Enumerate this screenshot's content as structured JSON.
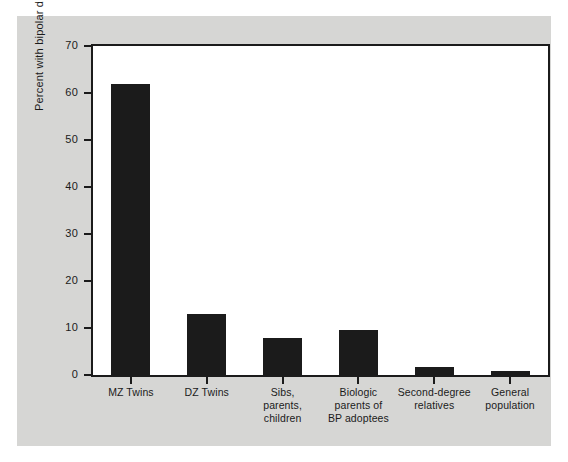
{
  "chart_data": {
    "type": "bar",
    "title": "",
    "subtitle": "",
    "xlabel": "",
    "ylabel": "Percent with bipolar disorder",
    "categories": [
      "MZ Twins",
      "DZ Twins",
      "Sibs,\nparents,\nchildren",
      "Biologic\nparents of\nBP adoptees",
      "Second-degree\nrelatives",
      "General\npopulation"
    ],
    "category_lines": [
      [
        "MZ Twins"
      ],
      [
        "DZ Twins"
      ],
      [
        "Sibs,",
        "parents,",
        "children"
      ],
      [
        "Biologic",
        "parents of",
        "BP adoptees"
      ],
      [
        "Second-degree",
        "relatives"
      ],
      [
        "General",
        "population"
      ]
    ],
    "values": [
      62,
      13,
      7.8,
      9.5,
      1.6,
      0.8
    ],
    "ylim": [
      0,
      70
    ],
    "yticks": [
      0,
      10,
      20,
      30,
      40,
      50,
      60,
      70
    ],
    "ytick_labels": [
      "0",
      "10",
      "20",
      "30",
      "40",
      "50",
      "60",
      "70"
    ],
    "grid": false,
    "legend": false,
    "legend_position": "none",
    "bar_color": "#1b1b1b",
    "plot_background": "#ffffff",
    "figure_background": "#d6d6d4",
    "axis_color": "#1b1b1b"
  }
}
